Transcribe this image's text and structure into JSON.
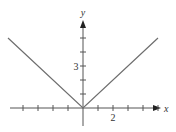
{
  "chart_data": {
    "type": "line",
    "title": "",
    "function": "y = |x|",
    "xlabel": "x",
    "ylabel": "y",
    "xlim": [
      -5,
      5
    ],
    "ylim": [
      0,
      5
    ],
    "grid": false,
    "legend": null,
    "x_tick_step": 1,
    "y_tick_step": 1,
    "x_tick_labels": [
      {
        "value": 2,
        "label": "2"
      }
    ],
    "y_tick_labels": [
      {
        "value": 3,
        "label": "3"
      }
    ],
    "series": [
      {
        "name": "y = |x|",
        "x": [
          -5,
          -4,
          -3,
          -2,
          -1,
          0,
          1,
          2,
          3,
          4,
          5
        ],
        "values": [
          5,
          4,
          3,
          2,
          1,
          0,
          1,
          2,
          3,
          4,
          5
        ]
      }
    ],
    "colors": {
      "axis": "#555555",
      "line": "#6e6e6e",
      "text": "#333333"
    }
  },
  "labels": {
    "x_axis": "x",
    "y_axis": "y",
    "x_tick_2": "2",
    "y_tick_3": "3"
  }
}
